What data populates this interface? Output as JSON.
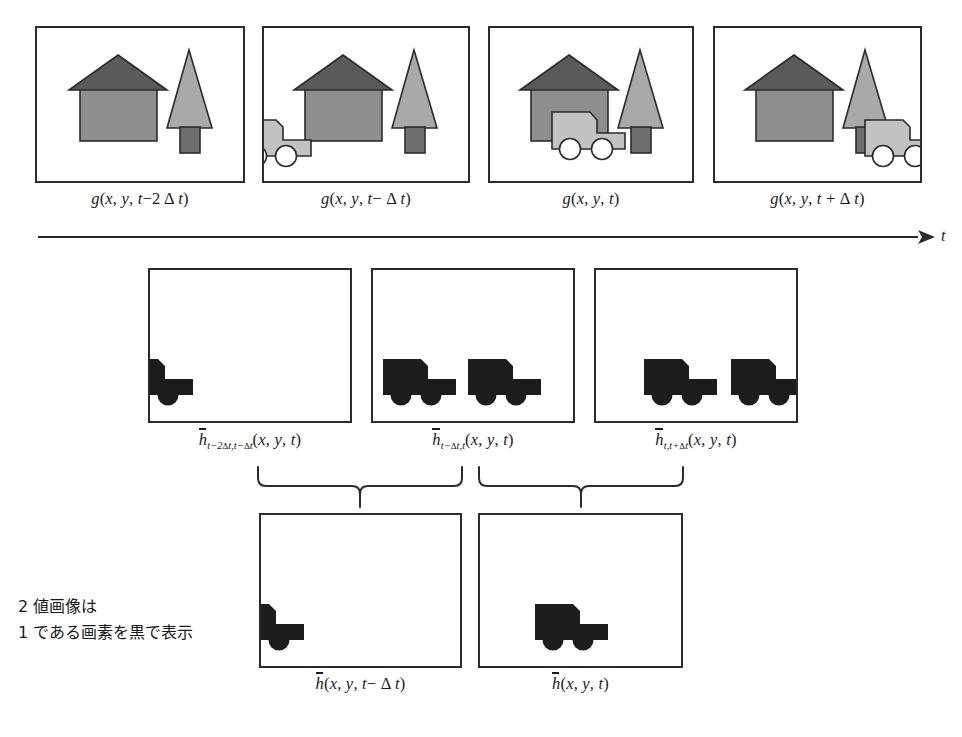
{
  "figure": {
    "background": "#ffffff",
    "stroke": "#2b2b2b",
    "colors": {
      "roof": "#5a5a5a",
      "wall": "#8e8e8e",
      "tree_foliage": "#a9a9a9",
      "tree_trunk": "#6e6e6e",
      "truck": "#c2c2c2",
      "binary_fill": "#1c1c1c",
      "line": "#2b2b2b"
    }
  },
  "time_axis": {
    "label": "t",
    "direction": "left-to-right"
  },
  "note": {
    "line1": "2 値画像は",
    "line2": "1 である画素を黒で表示",
    "full": "2 値画像は\n1 である画素を黒で表示"
  },
  "rows": {
    "grayscale": {
      "row_name": "input-frames",
      "panels": [
        {
          "id": "g-t-2dt",
          "caption_prefix": "g(x, y, t−2",
          "caption_delta": "Δ",
          "caption_suffix": "t)",
          "contents": [
            "house",
            "tree"
          ],
          "truck_position": "absent"
        },
        {
          "id": "g-t-dt",
          "caption_prefix": "g(x, y, t− ",
          "caption_delta": "Δ",
          "caption_suffix": "t)",
          "contents": [
            "house",
            "tree",
            "truck"
          ],
          "truck_position": "left-edge-clipped"
        },
        {
          "id": "g-t",
          "caption_prefix": "g(x, y, t)",
          "caption_delta": "",
          "caption_suffix": "",
          "contents": [
            "house",
            "tree",
            "truck"
          ],
          "truck_position": "center"
        },
        {
          "id": "g-t+dt",
          "caption_prefix": "g(x, y, t + ",
          "caption_delta": "Δ",
          "caption_suffix": "t)",
          "contents": [
            "house",
            "tree",
            "truck"
          ],
          "truck_position": "right-edge-clipped"
        }
      ]
    },
    "difference": {
      "row_name": "pairwise-difference-images",
      "panels": [
        {
          "id": "h-t2dt-tdt",
          "sub_a": "t−2",
          "sub_a_delta": "Δ",
          "sub_a_tail": "t,t− ",
          "sub_b_delta": "Δ",
          "sub_b_tail": "t",
          "caption_args": "(x, y, t)",
          "blobs": [
            "left-clipped-truck"
          ]
        },
        {
          "id": "h-tdt-t",
          "sub_a": "t− ",
          "sub_a_delta": "Δ",
          "sub_a_tail": "t,t",
          "sub_b_delta": "",
          "sub_b_tail": "",
          "caption_args": "(x, y, t)",
          "blobs": [
            "truck-left",
            "truck-center"
          ]
        },
        {
          "id": "h-t-tdt",
          "sub_a": "t,t+ ",
          "sub_a_delta": "Δ",
          "sub_a_tail": "t",
          "sub_b_delta": "",
          "sub_b_tail": "",
          "caption_args": "(x, y, t)",
          "blobs": [
            "truck-center",
            "truck-right-clipped"
          ]
        }
      ]
    },
    "result": {
      "row_name": "and-combined-images",
      "panels": [
        {
          "id": "h-t-dt",
          "caption_prefix": "(x, y, t− ",
          "caption_delta": "Δ",
          "caption_suffix": "t)",
          "blobs": [
            "left-clipped-truck"
          ]
        },
        {
          "id": "h-t",
          "caption_prefix": "(x, y, t)",
          "caption_delta": "",
          "caption_suffix": "",
          "blobs": [
            "truck-center"
          ]
        }
      ]
    }
  },
  "braces": [
    {
      "id": "brace-left",
      "spans": [
        "h-t2dt-tdt",
        "h-tdt-t"
      ],
      "points_to": "h-t-dt"
    },
    {
      "id": "brace-right",
      "spans": [
        "h-tdt-t",
        "h-t-tdt"
      ],
      "points_to": "h-t"
    }
  ]
}
